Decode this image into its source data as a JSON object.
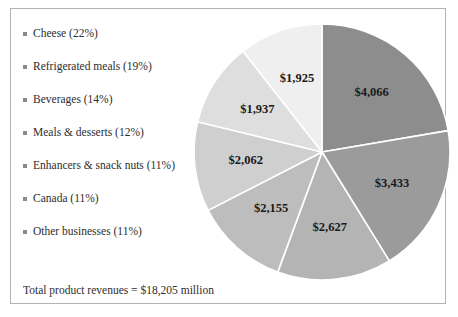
{
  "figure": {
    "total_note": "Total product revenues = $18,205 million"
  },
  "legend": {
    "items": [
      {
        "label": "Cheese (22%)",
        "marker": "square-bullet"
      },
      {
        "label": "Refrigerated meals (19%)",
        "marker": "square-bullet"
      },
      {
        "label": "Beverages (14%)",
        "marker": "square-bullet"
      },
      {
        "label": "Meals & desserts (12%)",
        "marker": "square-bullet"
      },
      {
        "label": "Enhancers & snack nuts (11%)",
        "marker": "square-bullet"
      },
      {
        "label": "Canada (11%)",
        "marker": "square-bullet"
      },
      {
        "label": "Other businesses (11%)",
        "marker": "square-bullet"
      }
    ]
  },
  "chart_data": {
    "type": "pie",
    "title": "",
    "categories": [
      "Cheese (22%)",
      "Refrigerated meals (19%)",
      "Beverages (14%)",
      "Meals & desserts (12%)",
      "Enhancers & snack nuts (11%)",
      "Canada (11%)",
      "Other businesses (11%)"
    ],
    "values": [
      4066,
      3433,
      2627,
      2155,
      2062,
      1937,
      1925
    ],
    "value_labels": [
      "$4,066",
      "$3,433",
      "$2,627",
      "$2,155",
      "$2,062",
      "$1,937",
      "$1,925"
    ],
    "percents": [
      22,
      19,
      14,
      12,
      11,
      11,
      11
    ],
    "colors": [
      "#8d8d8d",
      "#9b9b9b",
      "#b4b4b4",
      "#bdbdbd",
      "#cfcfcf",
      "#dedede",
      "#efefef"
    ],
    "slice_separator_color": "#ffffff",
    "start_angle_deg": 0,
    "direction": "clockwise",
    "legend_position": "left",
    "total": 18205,
    "total_label": "Total product revenues = $18,205 million",
    "units": "millions of dollars"
  }
}
